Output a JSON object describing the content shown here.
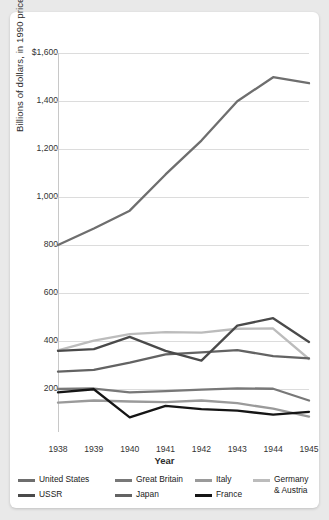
{
  "chart_data": {
    "type": "line",
    "title": "",
    "xlabel": "Year",
    "ylabel": "Billions of dollars, in 1990 prices",
    "categories": [
      "1938",
      "1939",
      "1940",
      "1941",
      "1942",
      "1943",
      "1944",
      "1945"
    ],
    "x": [
      1938,
      1939,
      1940,
      1941,
      1942,
      1943,
      1944,
      1945
    ],
    "ylim": [
      0,
      1600
    ],
    "xlim": [
      1938,
      1945
    ],
    "y_ticks": [
      "$1,600",
      "1,400",
      "1,200",
      "1,000",
      "800",
      "600",
      "400",
      "200"
    ],
    "y_tick_values": [
      1600,
      1400,
      1200,
      1000,
      800,
      600,
      400,
      200
    ],
    "grid": true,
    "legend_position": "bottom",
    "series": [
      {
        "name": "United States",
        "color": "#6e6e6e",
        "values": [
          800,
          869,
          943,
          1094,
          1235,
          1399,
          1499,
          1474
        ]
      },
      {
        "name": "USSR",
        "color": "#4a4a4a",
        "values": [
          359,
          366,
          417,
          359,
          318,
          464,
          495,
          396
        ]
      },
      {
        "name": "Great Britain",
        "color": "#787878",
        "values": [
          200,
          202,
          186,
          191,
          197,
          203,
          201,
          152
        ]
      },
      {
        "name": "Japan",
        "color": "#636363",
        "values": [
          272,
          280,
          310,
          344,
          353,
          362,
          337,
          328
        ]
      },
      {
        "name": "Italy",
        "color": "#9a9a9a",
        "values": [
          143,
          152,
          148,
          145,
          152,
          141,
          118,
          85
        ]
      },
      {
        "name": "France",
        "color": "#151515",
        "values": [
          186,
          199,
          82,
          130,
          116,
          110,
          93,
          105
        ]
      },
      {
        "name": "Germany & Austria",
        "color": "#bcbcbc",
        "values": [
          361,
          402,
          429,
          437,
          435,
          451,
          452,
          325
        ]
      }
    ]
  },
  "legend": {
    "items": [
      {
        "label": "United States",
        "color": "#6e6e6e"
      },
      {
        "label": "Great Britain",
        "color": "#787878"
      },
      {
        "label": "Italy",
        "color": "#9a9a9a"
      },
      {
        "label": "Germany & Austria",
        "color": "#bcbcbc"
      },
      {
        "label": "USSR",
        "color": "#4a4a4a"
      },
      {
        "label": "Japan",
        "color": "#636363"
      },
      {
        "label": "France",
        "color": "#151515"
      }
    ]
  },
  "style": {
    "page_background": "#e9e9e9",
    "card_background": "#ffffff",
    "grid_color": "#dcdcdc",
    "axis_color": "#c8c8c8",
    "text_color": "#333333"
  }
}
